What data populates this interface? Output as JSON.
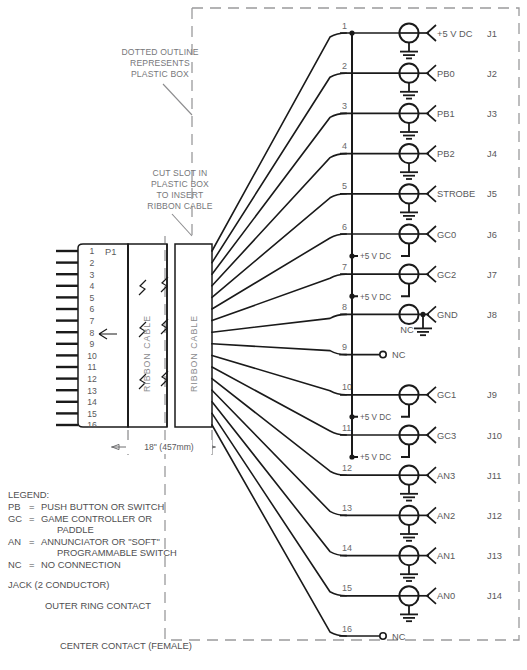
{
  "colors": {
    "line": "#1a1a1a",
    "text": "#59595b",
    "note_text": "#77777a",
    "dashed_box": "#9a9a9c",
    "background": "#ffffff"
  },
  "notes": {
    "plastic_box": "DOTTED OUTLINE\nREPRESENTS\nPLASTIC BOX",
    "plastic_box_lines": [
      "DOTTED OUTLINE",
      "REPRESENTS",
      "PLASTIC BOX"
    ],
    "cut_slot_lines": [
      "CUT SLOT IN",
      "PLASTIC BOX",
      "TO INSERT",
      "RIBBON CABLE"
    ]
  },
  "connector": {
    "label": "P1",
    "pin_numbers": [
      "1",
      "2",
      "3",
      "4",
      "5",
      "6",
      "7",
      "8",
      "9",
      "10",
      "11",
      "12",
      "13",
      "14",
      "15",
      "16"
    ],
    "cable_label": "RIBBON CABLE",
    "cable_label_2": "RIBBON CABLE",
    "dimension": "18\" (457mm)"
  },
  "jacks": [
    {
      "pin": "1",
      "signal": "+5 V DC",
      "jack": "J1",
      "type": "ground",
      "plus5": false
    },
    {
      "pin": "2",
      "signal": "PB0",
      "jack": "J2",
      "type": "ground",
      "plus5": false
    },
    {
      "pin": "3",
      "signal": "PB1",
      "jack": "J3",
      "type": "ground",
      "plus5": false
    },
    {
      "pin": "4",
      "signal": "PB2",
      "jack": "J4",
      "type": "ground",
      "plus5": false
    },
    {
      "pin": "5",
      "signal": "STROBE",
      "jack": "J5",
      "type": "ground",
      "plus5": false
    },
    {
      "pin": "6",
      "signal": "GC0",
      "jack": "J6",
      "type": "plain",
      "plus5": true
    },
    {
      "pin": "7",
      "signal": "GC2",
      "jack": "J7",
      "type": "plain",
      "plus5": true
    },
    {
      "pin": "8",
      "signal": "GND",
      "jack": "J8",
      "type": "gnd-right",
      "plus5": false,
      "sub_label": "NC"
    },
    {
      "pin": "9",
      "signal": "NC",
      "jack": "",
      "type": "nc",
      "plus5": false
    },
    {
      "pin": "10",
      "signal": "GC1",
      "jack": "J9",
      "type": "plain",
      "plus5": true
    },
    {
      "pin": "11",
      "signal": "GC3",
      "jack": "J10",
      "type": "plain",
      "plus5": true
    },
    {
      "pin": "12",
      "signal": "AN3",
      "jack": "J11",
      "type": "ground",
      "plus5": false
    },
    {
      "pin": "13",
      "signal": "AN2",
      "jack": "J12",
      "type": "ground",
      "plus5": false
    },
    {
      "pin": "14",
      "signal": "AN1",
      "jack": "J13",
      "type": "ground",
      "plus5": false
    },
    {
      "pin": "15",
      "signal": "AN0",
      "jack": "J14",
      "type": "ground",
      "plus5": false
    },
    {
      "pin": "16",
      "signal": "NC",
      "jack": "",
      "type": "nc",
      "plus5": false
    }
  ],
  "bus_label": "+5 V DC",
  "legend": {
    "heading": "LEGEND:",
    "entries": [
      {
        "abbr": "PB",
        "eq": "=",
        "desc": "PUSH BUTTON OR SWITCH",
        "desc2": ""
      },
      {
        "abbr": "GC",
        "eq": "=",
        "desc": "GAME CONTROLLER OR",
        "desc2": "PADDLE"
      },
      {
        "abbr": "AN",
        "eq": "=",
        "desc": "ANNUNCIATOR OR \"SOFT\"",
        "desc2": "PROGRAMMABLE SWITCH"
      },
      {
        "abbr": "NC",
        "eq": "=",
        "desc": "NO CONNECTION",
        "desc2": ""
      }
    ],
    "jack_title": "JACK (2 CONDUCTOR)",
    "outer_ring": "OUTER RING CONTACT",
    "center_contact": "CENTER CONTACT (FEMALE)"
  }
}
